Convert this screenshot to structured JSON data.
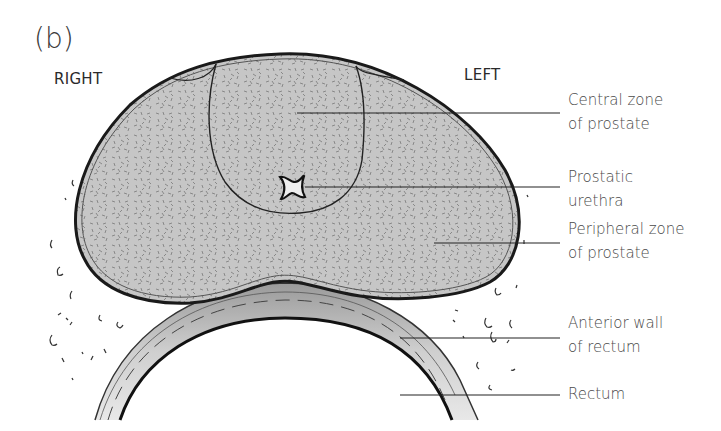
{
  "figure": {
    "panel_label": "(b)",
    "orientation": {
      "right": "RIGHT",
      "left": "LEFT"
    },
    "labels": [
      {
        "line1": "Central zone",
        "line2": "of prostate"
      },
      {
        "line1": "Prostatic",
        "line2": "urethra"
      },
      {
        "line1": "Peripheral zone",
        "line2": "of prostate"
      },
      {
        "line1": "Anterior wall",
        "line2": "of rectum"
      },
      {
        "line1": "Rectum",
        "line2": ""
      }
    ],
    "colors": {
      "prostate_fill": "#c4c4c4",
      "outline": "#222222",
      "rectum_wall": "#bdbdbd",
      "text": "#4a4a4a"
    }
  }
}
